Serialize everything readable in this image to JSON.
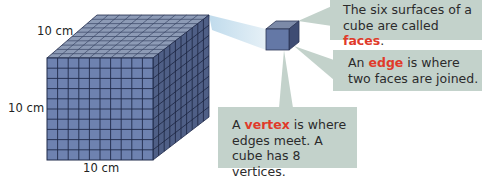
{
  "diagram": {
    "subject": "cube",
    "dimension_labels": {
      "top_depth": "10 cm",
      "left_height": "10 cm",
      "bottom_width": "10 cm"
    },
    "grid_cells_per_edge": 10,
    "callouts": {
      "faces": {
        "line1": "The six surfaces of a",
        "line2_prefix": "cube are called ",
        "keyword": "faces",
        "line2_suffix": "."
      },
      "edge": {
        "line1_prefix": "An ",
        "keyword": "edge",
        "line1_suffix": " is where",
        "line2": "two faces are joined."
      },
      "vertex": {
        "line1_prefix": "A ",
        "keyword": "vertex",
        "line1_suffix": " is where",
        "line2": "edges meet. A",
        "line3": "cube has 8 vertices."
      }
    },
    "colors": {
      "cube_front": "#6e82b0",
      "cube_top": "#8d9bb6",
      "cube_side": "#4f5f86",
      "grid_line": "#1f2a4a",
      "callout_bg": "#c3d2cb",
      "keyword": "#e03a2a",
      "beam": "#cfe3ef"
    }
  }
}
